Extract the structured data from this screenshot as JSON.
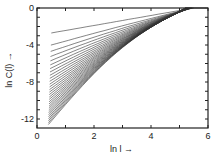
{
  "chart_data": {
    "type": "line",
    "title": "",
    "xlabel": "ln l",
    "ylabel": "ln C(l)",
    "xlim": [
      0,
      6
    ],
    "ylim": [
      -13,
      0
    ],
    "x_ticks": [
      "0",
      "2",
      "4",
      "6"
    ],
    "y_ticks": [
      "0",
      "-4",
      "-8",
      "-12"
    ],
    "grid": false,
    "legend": null,
    "series_envelope": {
      "top_curve": {
        "x": [
          0.5,
          2,
          4,
          5,
          5.5
        ],
        "y": [
          -2.7,
          -2.0,
          -0.8,
          -0.2,
          0
        ]
      },
      "bottom_curve": {
        "x": [
          0.4,
          1,
          2,
          3,
          4,
          4.6,
          5.2
        ],
        "y": [
          -12.6,
          -10.5,
          -8.0,
          -5.5,
          -3.0,
          -1.0,
          0
        ]
      }
    },
    "series_count": 30
  },
  "labels": {
    "x_axis": "ln l",
    "y_axis": "ln C(l)",
    "x_ticks": [
      "0",
      "2",
      "4",
      "6"
    ],
    "y_ticks": [
      "0",
      "-4",
      "-8",
      "-12"
    ]
  }
}
